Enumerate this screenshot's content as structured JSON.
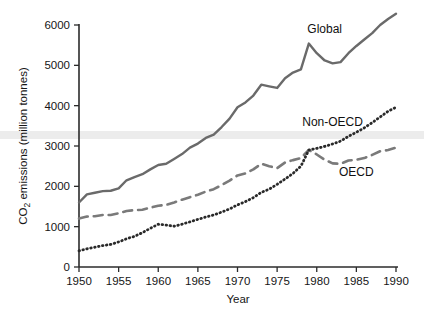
{
  "chart_data": {
    "type": "line",
    "title": "",
    "xlabel": "Year",
    "ylabel": "CO2 emissions (million tonnes)",
    "ylabel_prefix": "CO",
    "ylabel_subscript": "2",
    "ylabel_suffix": " emissions (million tonnes)",
    "xlim": [
      1950,
      1990
    ],
    "ylim": [
      0,
      6000
    ],
    "xticks": [
      1950,
      1955,
      1960,
      1965,
      1970,
      1975,
      1980,
      1985,
      1990
    ],
    "yticks": [
      0,
      1000,
      2000,
      3000,
      4000,
      5000,
      6000
    ],
    "grid": false,
    "legend_position": "inline-annotations",
    "x": [
      1950,
      1951,
      1952,
      1953,
      1954,
      1955,
      1956,
      1957,
      1958,
      1959,
      1960,
      1961,
      1962,
      1963,
      1964,
      1965,
      1966,
      1967,
      1968,
      1969,
      1970,
      1971,
      1972,
      1973,
      1974,
      1975,
      1976,
      1977,
      1978,
      1979,
      1980,
      1981,
      1982,
      1983,
      1984,
      1985,
      1986,
      1987,
      1988,
      1989,
      1990
    ],
    "series": [
      {
        "name": "Global",
        "style": "solid",
        "color": "#6a6a6a",
        "label": "Global",
        "values": [
          1600,
          1800,
          1840,
          1880,
          1890,
          1950,
          2150,
          2230,
          2300,
          2420,
          2530,
          2560,
          2680,
          2800,
          2960,
          3060,
          3200,
          3280,
          3470,
          3680,
          3960,
          4080,
          4250,
          4520,
          4480,
          4440,
          4680,
          4820,
          4900,
          5540,
          5300,
          5120,
          5050,
          5080,
          5300,
          5480,
          5640,
          5800,
          6000,
          6150,
          6280
        ]
      },
      {
        "name": "OECD",
        "style": "dashed",
        "color": "#7a7a7a",
        "label": "OECD",
        "values": [
          1200,
          1250,
          1260,
          1290,
          1290,
          1330,
          1390,
          1410,
          1420,
          1470,
          1520,
          1540,
          1600,
          1670,
          1730,
          1790,
          1870,
          1930,
          2030,
          2140,
          2270,
          2320,
          2420,
          2560,
          2500,
          2450,
          2590,
          2650,
          2700,
          2900,
          2790,
          2660,
          2570,
          2560,
          2640,
          2660,
          2700,
          2780,
          2870,
          2900,
          2960
        ]
      },
      {
        "name": "Non-OECD",
        "style": "dotted",
        "color": "#2a2a2a",
        "label": "Non-OECD",
        "values": [
          400,
          450,
          490,
          530,
          560,
          620,
          700,
          760,
          850,
          960,
          1060,
          1040,
          1010,
          1060,
          1120,
          1180,
          1240,
          1290,
          1360,
          1440,
          1540,
          1620,
          1720,
          1850,
          1930,
          2050,
          2180,
          2320,
          2500,
          2900,
          2940,
          2990,
          3050,
          3120,
          3240,
          3340,
          3450,
          3580,
          3720,
          3860,
          3960
        ]
      }
    ],
    "annotations": [
      {
        "text": "Global",
        "x": 1981,
        "y": 5800
      },
      {
        "text": "Non-OECD",
        "x": 1982,
        "y": 3500
      },
      {
        "text": "OECD",
        "x": 1985,
        "y": 2250
      }
    ]
  }
}
